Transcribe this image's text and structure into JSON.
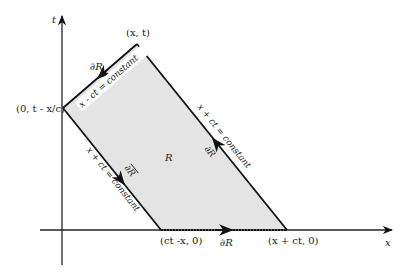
{
  "diagram": {
    "axes": {
      "t_label": "t",
      "x_label": "x"
    },
    "vertices": {
      "apex": "(x, t)",
      "left": "(0, t - x/c)",
      "bottom_left": "(ct -x, 0)",
      "bottom_right": "(x + ct, 0)"
    },
    "region_label": "R",
    "edges": {
      "upper_left_eq": "x - ct = constant",
      "upper_left_boundary": "∂R",
      "right_eq": "x + ct = constant",
      "right_boundary": "∂R",
      "lower_left_eq": "x + ct = constant",
      "lower_left_boundary": "∂R",
      "bottom_boundary": "∂R"
    },
    "colors": {
      "fill": "#e4e4e4",
      "line": "#111111"
    }
  }
}
